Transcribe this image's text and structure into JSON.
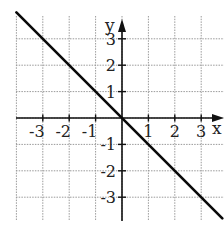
{
  "chart_data": {
    "type": "line",
    "title": "",
    "xlabel": "x",
    "ylabel": "y",
    "xlim": [
      -4,
      4
    ],
    "ylim": [
      -4,
      3.8
    ],
    "grid": true,
    "x_ticks": [
      -3,
      -2,
      -1,
      1,
      2,
      3
    ],
    "y_ticks": [
      3,
      2,
      1,
      -1,
      -2,
      -3
    ],
    "x_tick_labels": [
      "-3",
      "-2",
      "-1",
      "1",
      "2",
      "3"
    ],
    "y_tick_labels": [
      "3",
      "2",
      "1",
      "-1",
      "-2",
      "-3"
    ],
    "series": [
      {
        "name": "y = -x",
        "equation": "y = -x",
        "x": [
          -4,
          3.8
        ],
        "y": [
          4,
          -3.8
        ],
        "color": "#0a0a0a"
      }
    ]
  }
}
